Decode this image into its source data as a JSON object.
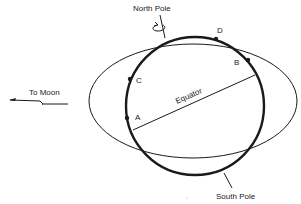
{
  "diagram": {
    "labels": {
      "north_pole": "North Pole",
      "south_pole": "South Pole",
      "equator": "Equator",
      "to_moon": "To Moon"
    },
    "points": [
      {
        "id": "A",
        "label": "A"
      },
      {
        "id": "B",
        "label": "B"
      },
      {
        "id": "C",
        "label": "C"
      },
      {
        "id": "D",
        "label": "D"
      }
    ],
    "colors": {
      "stroke": "#1a1a1a",
      "background": "#ffffff"
    }
  }
}
